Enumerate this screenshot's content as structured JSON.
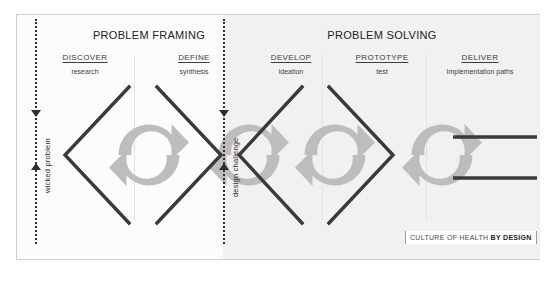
{
  "diagram": {
    "bands": [
      {
        "id": "framing",
        "label": "PROBLEM FRAMING"
      },
      {
        "id": "solving",
        "label": "PROBLEM SOLVING"
      }
    ],
    "phases": [
      {
        "name": "DISCOVER",
        "subtitle": "research"
      },
      {
        "name": "DEFINE",
        "subtitle": "synthesis"
      },
      {
        "name": "DEVELOP",
        "subtitle": "ideation"
      },
      {
        "name": "PROTOTYPE",
        "subtitle": "test"
      },
      {
        "name": "DELIVER",
        "subtitle": "Implementation paths"
      }
    ],
    "rails": [
      {
        "id": "wicked-problem",
        "label": "wicked problem"
      },
      {
        "id": "design-challenge",
        "label": "design challenge"
      }
    ],
    "icons": {
      "cycle": "cycle-arrows-icon",
      "chevron_left": "chevron-left-icon",
      "chevron_right": "chevron-right-icon",
      "arrow_down": "arrow-down-icon",
      "arrow_up": "arrow-up-icon",
      "path_line": "implementation-path-line"
    },
    "logo": {
      "prefix": "CULTURE OF HEALTH ",
      "bold": "BY DESIGN"
    },
    "colors": {
      "frame": "#d0d0d0",
      "wash": "#f1f1f1",
      "stroke_dark": "#3a3a3a",
      "cycle_gray": "#bdbdbd",
      "rail": "#2f2f2f",
      "text": "#2b2b2b"
    }
  }
}
